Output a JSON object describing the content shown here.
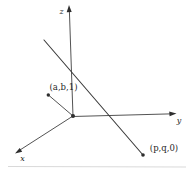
{
  "figure": {
    "axis_labels": {
      "x": "x",
      "y": "y",
      "z": "z"
    },
    "point_labels": {
      "normal_point": "(a,b,1)",
      "line_point": "(p,q,0)"
    },
    "colors": {
      "background": "#ffffff",
      "line": "#3f3f3f",
      "text": "#1f1f1f",
      "scan_artifact": "#d9d9d9"
    }
  }
}
